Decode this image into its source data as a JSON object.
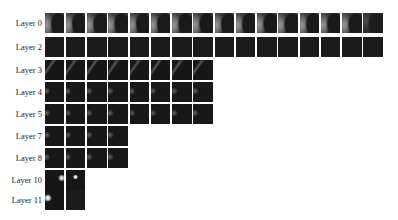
{
  "figure": {
    "rows": [
      {
        "label": "Layer 0",
        "top": 13,
        "count": 16,
        "style": "t-crescent",
        "last_style": "t-crescent-faint"
      },
      {
        "label": "Layer 2",
        "top": 37,
        "count": 16,
        "style": "t-dark",
        "last_style": "t-dark"
      },
      {
        "label": "Layer 3",
        "top": 60,
        "count": 8,
        "style": "t-streak",
        "last_style": "t-streak"
      },
      {
        "label": "Layer 4",
        "top": 82,
        "count": 8,
        "style": "t-faint",
        "last_style": "t-faint"
      },
      {
        "label": "Layer 5",
        "top": 104,
        "count": 8,
        "style": "t-faint",
        "last_style": "t-faint"
      },
      {
        "label": "Layer 7",
        "top": 126,
        "count": 4,
        "style": "t-faint",
        "last_style": "t-faint"
      },
      {
        "label": "Layer 8",
        "top": 148,
        "count": 4,
        "style": "t-faint",
        "last_style": "t-faint"
      },
      {
        "label": "Layer 10",
        "top": 170,
        "count": 2,
        "style": "t-dot-right",
        "last_style": "t-dot"
      },
      {
        "label": "Layer 11",
        "top": 190,
        "count": 2,
        "style": "t-dot-left",
        "last_style": "t-dark"
      }
    ],
    "tile_pitch": 21.25
  }
}
